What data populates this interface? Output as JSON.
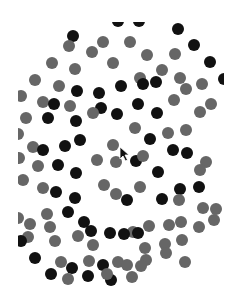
{
  "scene": {
    "description": "Field of black and gray dots on white (multiple object tracking display)",
    "colors": {
      "background": "#ffffff",
      "black_dot": "#111111",
      "gray_dot": "#666666"
    },
    "dot_radius": 6,
    "clip_region": {
      "left": 18,
      "top": 22,
      "right": 224,
      "bottom": 286
    },
    "dots": [
      {
        "x": 118,
        "y": 21,
        "c": "black"
      },
      {
        "x": 139,
        "y": 21,
        "c": "black"
      },
      {
        "x": 73,
        "y": 36,
        "c": "black"
      },
      {
        "x": 178,
        "y": 29,
        "c": "black"
      },
      {
        "x": 194,
        "y": 45,
        "c": "black"
      },
      {
        "x": 210,
        "y": 62,
        "c": "black"
      },
      {
        "x": 224,
        "y": 79,
        "c": "black"
      },
      {
        "x": 69,
        "y": 46,
        "c": "gray"
      },
      {
        "x": 103,
        "y": 42,
        "c": "gray"
      },
      {
        "x": 130,
        "y": 42,
        "c": "gray"
      },
      {
        "x": 52,
        "y": 63,
        "c": "gray"
      },
      {
        "x": 75,
        "y": 69,
        "c": "gray"
      },
      {
        "x": 92,
        "y": 52,
        "c": "gray"
      },
      {
        "x": 113,
        "y": 63,
        "c": "gray"
      },
      {
        "x": 147,
        "y": 55,
        "c": "gray"
      },
      {
        "x": 175,
        "y": 54,
        "c": "gray"
      },
      {
        "x": 35,
        "y": 80,
        "c": "gray"
      },
      {
        "x": 59,
        "y": 86,
        "c": "gray"
      },
      {
        "x": 140,
        "y": 78,
        "c": "gray"
      },
      {
        "x": 162,
        "y": 70,
        "c": "gray"
      },
      {
        "x": 180,
        "y": 78,
        "c": "gray"
      },
      {
        "x": 202,
        "y": 84,
        "c": "gray"
      },
      {
        "x": 21,
        "y": 96,
        "c": "gray"
      },
      {
        "x": 77,
        "y": 91,
        "c": "black"
      },
      {
        "x": 99,
        "y": 93,
        "c": "black"
      },
      {
        "x": 121,
        "y": 86,
        "c": "black"
      },
      {
        "x": 143,
        "y": 84,
        "c": "black"
      },
      {
        "x": 156,
        "y": 82,
        "c": "black"
      },
      {
        "x": 26,
        "y": 118,
        "c": "gray"
      },
      {
        "x": 43,
        "y": 102,
        "c": "gray"
      },
      {
        "x": 54,
        "y": 104,
        "c": "black"
      },
      {
        "x": 70,
        "y": 106,
        "c": "gray"
      },
      {
        "x": 76,
        "y": 121,
        "c": "black"
      },
      {
        "x": 101,
        "y": 108,
        "c": "black"
      },
      {
        "x": 117,
        "y": 114,
        "c": "black"
      },
      {
        "x": 138,
        "y": 104,
        "c": "black"
      },
      {
        "x": 157,
        "y": 113,
        "c": "black"
      },
      {
        "x": 174,
        "y": 100,
        "c": "gray"
      },
      {
        "x": 186,
        "y": 89,
        "c": "gray"
      },
      {
        "x": 211,
        "y": 104,
        "c": "gray"
      },
      {
        "x": 48,
        "y": 118,
        "c": "black"
      },
      {
        "x": 93,
        "y": 113,
        "c": "gray"
      },
      {
        "x": 135,
        "y": 128,
        "c": "gray"
      },
      {
        "x": 150,
        "y": 139,
        "c": "black"
      },
      {
        "x": 168,
        "y": 133,
        "c": "gray"
      },
      {
        "x": 186,
        "y": 130,
        "c": "gray"
      },
      {
        "x": 200,
        "y": 112,
        "c": "gray"
      },
      {
        "x": 18,
        "y": 134,
        "c": "gray"
      },
      {
        "x": 33,
        "y": 147,
        "c": "gray"
      },
      {
        "x": 43,
        "y": 150,
        "c": "black"
      },
      {
        "x": 65,
        "y": 146,
        "c": "black"
      },
      {
        "x": 80,
        "y": 140,
        "c": "black"
      },
      {
        "x": 113,
        "y": 145,
        "c": "gray"
      },
      {
        "x": 97,
        "y": 160,
        "c": "gray"
      },
      {
        "x": 116,
        "y": 162,
        "c": "gray"
      },
      {
        "x": 136,
        "y": 161,
        "c": "black"
      },
      {
        "x": 143,
        "y": 156,
        "c": "gray"
      },
      {
        "x": 158,
        "y": 172,
        "c": "black"
      },
      {
        "x": 173,
        "y": 150,
        "c": "black"
      },
      {
        "x": 187,
        "y": 153,
        "c": "black"
      },
      {
        "x": 206,
        "y": 162,
        "c": "gray"
      },
      {
        "x": 23,
        "y": 180,
        "c": "gray"
      },
      {
        "x": 19,
        "y": 158,
        "c": "gray"
      },
      {
        "x": 38,
        "y": 166,
        "c": "gray"
      },
      {
        "x": 58,
        "y": 165,
        "c": "black"
      },
      {
        "x": 76,
        "y": 173,
        "c": "black"
      },
      {
        "x": 43,
        "y": 188,
        "c": "gray"
      },
      {
        "x": 56,
        "y": 192,
        "c": "black"
      },
      {
        "x": 75,
        "y": 198,
        "c": "black"
      },
      {
        "x": 104,
        "y": 185,
        "c": "gray"
      },
      {
        "x": 116,
        "y": 194,
        "c": "gray"
      },
      {
        "x": 127,
        "y": 200,
        "c": "black"
      },
      {
        "x": 140,
        "y": 187,
        "c": "gray"
      },
      {
        "x": 162,
        "y": 199,
        "c": "black"
      },
      {
        "x": 180,
        "y": 189,
        "c": "black"
      },
      {
        "x": 199,
        "y": 187,
        "c": "black"
      },
      {
        "x": 200,
        "y": 170,
        "c": "gray"
      },
      {
        "x": 203,
        "y": 208,
        "c": "gray"
      },
      {
        "x": 216,
        "y": 209,
        "c": "gray"
      },
      {
        "x": 179,
        "y": 200,
        "c": "gray"
      },
      {
        "x": 18,
        "y": 218,
        "c": "gray"
      },
      {
        "x": 30,
        "y": 224,
        "c": "gray"
      },
      {
        "x": 47,
        "y": 214,
        "c": "gray"
      },
      {
        "x": 68,
        "y": 212,
        "c": "black"
      },
      {
        "x": 84,
        "y": 222,
        "c": "black"
      },
      {
        "x": 91,
        "y": 231,
        "c": "black"
      },
      {
        "x": 110,
        "y": 233,
        "c": "black"
      },
      {
        "x": 133,
        "y": 232,
        "c": "gray"
      },
      {
        "x": 149,
        "y": 226,
        "c": "gray"
      },
      {
        "x": 169,
        "y": 225,
        "c": "gray"
      },
      {
        "x": 181,
        "y": 222,
        "c": "gray"
      },
      {
        "x": 199,
        "y": 227,
        "c": "gray"
      },
      {
        "x": 214,
        "y": 220,
        "c": "gray"
      },
      {
        "x": 50,
        "y": 227,
        "c": "gray"
      },
      {
        "x": 28,
        "y": 237,
        "c": "gray"
      },
      {
        "x": 21,
        "y": 241,
        "c": "black"
      },
      {
        "x": 55,
        "y": 241,
        "c": "gray"
      },
      {
        "x": 78,
        "y": 236,
        "c": "gray"
      },
      {
        "x": 93,
        "y": 245,
        "c": "gray"
      },
      {
        "x": 124,
        "y": 234,
        "c": "black"
      },
      {
        "x": 138,
        "y": 233,
        "c": "black"
      },
      {
        "x": 145,
        "y": 248,
        "c": "gray"
      },
      {
        "x": 165,
        "y": 244,
        "c": "gray"
      },
      {
        "x": 182,
        "y": 240,
        "c": "gray"
      },
      {
        "x": 35,
        "y": 258,
        "c": "black"
      },
      {
        "x": 61,
        "y": 262,
        "c": "gray"
      },
      {
        "x": 72,
        "y": 268,
        "c": "black"
      },
      {
        "x": 89,
        "y": 261,
        "c": "gray"
      },
      {
        "x": 103,
        "y": 265,
        "c": "black"
      },
      {
        "x": 118,
        "y": 262,
        "c": "gray"
      },
      {
        "x": 127,
        "y": 265,
        "c": "gray"
      },
      {
        "x": 146,
        "y": 260,
        "c": "gray"
      },
      {
        "x": 166,
        "y": 253,
        "c": "gray"
      },
      {
        "x": 185,
        "y": 262,
        "c": "gray"
      },
      {
        "x": 51,
        "y": 274,
        "c": "black"
      },
      {
        "x": 68,
        "y": 279,
        "c": "gray"
      },
      {
        "x": 88,
        "y": 276,
        "c": "black"
      },
      {
        "x": 111,
        "y": 280,
        "c": "black"
      },
      {
        "x": 107,
        "y": 274,
        "c": "gray"
      },
      {
        "x": 132,
        "y": 277,
        "c": "gray"
      },
      {
        "x": 141,
        "y": 266,
        "c": "gray"
      }
    ],
    "cursor": {
      "x": 120,
      "y": 148
    }
  }
}
